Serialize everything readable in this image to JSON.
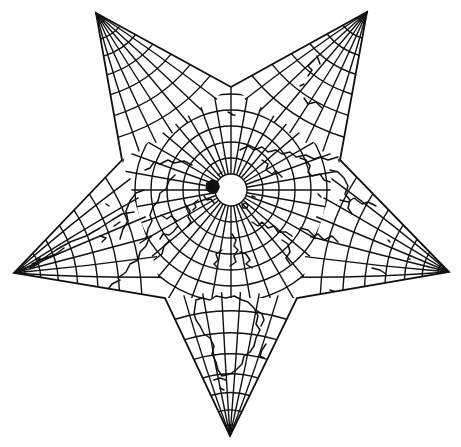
{
  "map": {
    "projection": "star",
    "center_pole": [
      231,
      190
    ],
    "outer_tips": [
      [
        96,
        13
      ],
      [
        367,
        12
      ],
      [
        449,
        272
      ],
      [
        230,
        436
      ],
      [
        14,
        273
      ]
    ],
    "inner_vertices": [
      [
        231,
        87
      ],
      [
        340,
        160
      ],
      [
        297,
        298
      ],
      [
        165,
        298
      ],
      [
        122,
        160
      ]
    ],
    "colors": {
      "background": "#ffffff",
      "line": "#111111"
    },
    "grid": {
      "polar_circle_radii": [
        18,
        36,
        54,
        72,
        90,
        108
      ],
      "meridian_count": 36
    }
  }
}
